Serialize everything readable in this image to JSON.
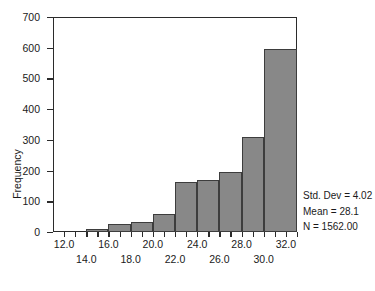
{
  "chart_data": {
    "type": "bar",
    "title": "",
    "subtitle": "",
    "xlabel": "",
    "ylabel": "Frequency",
    "grid": false,
    "legend": null,
    "xlim": [
      11,
      33
    ],
    "ylim": [
      0,
      700
    ],
    "bin_width": 2,
    "categories": [
      "12-14",
      "14-16",
      "16-18",
      "18-20",
      "20-22",
      "22-24",
      "24-26",
      "26-28",
      "28-30",
      "30-32",
      "32-34"
    ],
    "bin_starts": [
      12,
      14,
      16,
      18,
      20,
      22,
      24,
      26,
      28,
      30,
      32
    ],
    "values": [
      0,
      9,
      25,
      32,
      60,
      163,
      170,
      195,
      308,
      595,
      0
    ],
    "bars": [
      {
        "start": 14,
        "end": 16,
        "value": 9
      },
      {
        "start": 16,
        "end": 18,
        "value": 25
      },
      {
        "start": 18,
        "end": 20,
        "value": 32
      },
      {
        "start": 20,
        "end": 22,
        "value": 60
      },
      {
        "start": 22,
        "end": 24,
        "value": 163
      },
      {
        "start": 24,
        "end": 26,
        "value": 170
      },
      {
        "start": 26,
        "end": 28,
        "value": 195
      },
      {
        "start": 28,
        "end": 30,
        "value": 308
      },
      {
        "start": 30,
        "end": 33,
        "value": 595
      }
    ],
    "y_ticks": [
      0,
      100,
      200,
      300,
      400,
      500,
      600,
      700
    ],
    "y_tick_labels": [
      "0",
      "100",
      "200",
      "300",
      "400",
      "500",
      "600",
      "700"
    ],
    "x_ticks": [
      12,
      13,
      14,
      15,
      16,
      17,
      18,
      19,
      20,
      21,
      22,
      23,
      24,
      25,
      26,
      27,
      28,
      29,
      30,
      31,
      32,
      33
    ],
    "x_tick_labels_top": [
      {
        "value": 12,
        "label": "12.0"
      },
      {
        "value": 16,
        "label": "16.0"
      },
      {
        "value": 20,
        "label": "20.0"
      },
      {
        "value": 24,
        "label": "24.0"
      },
      {
        "value": 28,
        "label": "28.0"
      },
      {
        "value": 32,
        "label": "32.0"
      }
    ],
    "x_tick_labels_bottom": [
      {
        "value": 14,
        "label": "14.0"
      },
      {
        "value": 18,
        "label": "18.0"
      },
      {
        "value": 22,
        "label": "22.0"
      },
      {
        "value": 26,
        "label": "26.0"
      },
      {
        "value": 30,
        "label": "30.0"
      }
    ],
    "annotations": [
      "Std. Dev = 4.02",
      "Mean = 28.1",
      "N = 1562.00"
    ],
    "colors": {
      "bar_fill": "#888888",
      "bar_edge": "#3d3d3d",
      "axis": "#2b2b2b",
      "text": "#1a1a1a",
      "background": "#ffffff"
    }
  },
  "stats": {
    "std_dev": "Std. Dev = 4.02",
    "mean": "Mean = 28.1",
    "n": "N = 1562.00"
  },
  "axis": {
    "y_title": "Frequency"
  }
}
